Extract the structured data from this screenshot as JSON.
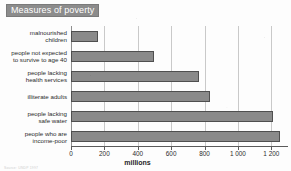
{
  "title": "Measures of poverty",
  "source_note": "Source: UNDP 1997",
  "chart_data": {
    "type": "bar",
    "orientation": "horizontal",
    "title": "Measures of poverty",
    "xlabel": "millions",
    "ylabel": "",
    "xlim": [
      0,
      1300
    ],
    "grid": true,
    "legend": "none",
    "categories": [
      "malnourished\nchildren",
      "people not expected\nto survive to age 40",
      "people lacking\nhealth services",
      "illiterate adults",
      "people lacking\nsafe water",
      "people who are\nincome-poor"
    ],
    "values": [
      160,
      500,
      765,
      835,
      1210,
      1250
    ],
    "xticks": [
      0,
      200,
      400,
      600,
      800,
      1000,
      1200
    ],
    "xticklabels": [
      "0",
      "200",
      "400",
      "600",
      "800",
      "1 000",
      "1 200"
    ],
    "bar_color": "#8a8a8a",
    "bar_edge_color": "#4f4f4f",
    "banner_color": "#8c8c8c",
    "banner_text_color": "#ffffff"
  }
}
